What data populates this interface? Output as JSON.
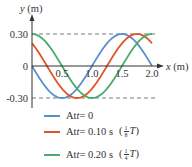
{
  "chart_data": {
    "type": "line",
    "title": "",
    "xlabel": "x (m)",
    "ylabel": "y (m)",
    "xlim": [
      0,
      2.0
    ],
    "ylim": [
      -0.3,
      0.3
    ],
    "x_ticks": [
      "0.5",
      "1.0",
      "1.5",
      "2.0"
    ],
    "y_ticks": [
      "0.30",
      "0",
      "-0.30"
    ],
    "grid": false,
    "dashed_reference_lines": [
      0.3,
      -0.3
    ],
    "legend_position": "bottom",
    "x": [
      0,
      0.25,
      0.5,
      0.75,
      1.0,
      1.25,
      1.5,
      1.75,
      2.0
    ],
    "series": [
      {
        "name": "At t = 0",
        "color": "#5b8fc9",
        "values": [
          0,
          -0.21,
          -0.3,
          -0.21,
          0,
          0.21,
          0.3,
          0.21,
          0
        ]
      },
      {
        "name": "At t = 0.10 s (1/8 T)",
        "color": "#e0522a",
        "values": [
          0.21,
          0,
          -0.21,
          -0.3,
          -0.21,
          0,
          0.21,
          0.3,
          0.21
        ]
      },
      {
        "name": "At t = 0.20 s (1/4 T)",
        "color": "#4aaa6a",
        "values": [
          0.3,
          0.21,
          0,
          -0.21,
          -0.3,
          -0.21,
          0,
          0.21,
          0.3
        ]
      }
    ]
  },
  "legend": [
    {
      "prefix": "At ",
      "var": "t",
      "rest": " = 0",
      "frac_num": "",
      "frac_den": "",
      "frac_var": ""
    },
    {
      "prefix": "At ",
      "var": "t",
      "rest": " = 0.10 s",
      "frac_num": "1",
      "frac_den": "8",
      "frac_var": "T"
    },
    {
      "prefix": "At ",
      "var": "t",
      "rest": " = 0.20 s",
      "frac_num": "1",
      "frac_den": "4",
      "frac_var": "T"
    }
  ]
}
